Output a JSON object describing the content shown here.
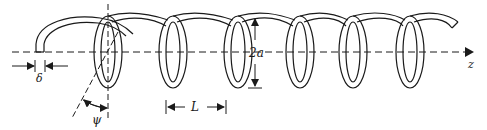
{
  "figure": {
    "labels": {
      "delta": "δ",
      "psi": "ψ",
      "diameter": "2a",
      "pitch": "L",
      "axis": "z"
    },
    "colors": {
      "stroke": "#1a1a1a",
      "background": "#ffffff"
    },
    "geometry": {
      "axis_y": 52,
      "coil_top_y": 17,
      "coil_bottom_y": 88,
      "turn_centers_x": [
        108,
        173,
        238,
        300,
        353,
        410
      ],
      "turn_count": 6
    }
  }
}
